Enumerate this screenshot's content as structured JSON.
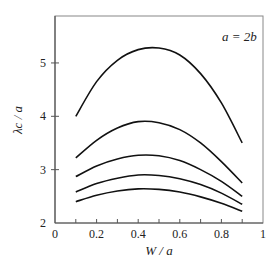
{
  "chart_data": {
    "type": "line",
    "title": "",
    "annotation": "a = 2b",
    "xlabel": "W / a",
    "ylabel": "λc / a",
    "xlim": [
      0,
      1
    ],
    "ylim": [
      2,
      5.88
    ],
    "xticks": [
      0,
      0.2,
      0.4,
      0.6,
      0.8,
      1
    ],
    "xtick_labels": [
      "0",
      "0.2",
      "0.4",
      "0.6",
      "0.8",
      "1"
    ],
    "yticks": [
      2,
      3,
      4,
      5
    ],
    "ytick_labels": [
      "2",
      "3",
      "4",
      "5"
    ],
    "grid": false,
    "legend": null,
    "x": [
      0.1,
      0.2,
      0.3,
      0.4,
      0.5,
      0.6,
      0.7,
      0.8,
      0.9
    ],
    "series": [
      {
        "name": "curve-1",
        "values": [
          4.0,
          4.65,
          5.05,
          5.25,
          5.28,
          5.15,
          4.8,
          4.25,
          3.5
        ]
      },
      {
        "name": "curve-2",
        "values": [
          3.22,
          3.55,
          3.78,
          3.9,
          3.88,
          3.75,
          3.5,
          3.15,
          2.75
        ]
      },
      {
        "name": "curve-3",
        "values": [
          2.87,
          3.07,
          3.2,
          3.27,
          3.26,
          3.17,
          3.0,
          2.78,
          2.5
        ]
      },
      {
        "name": "curve-4",
        "values": [
          2.58,
          2.74,
          2.84,
          2.9,
          2.89,
          2.83,
          2.72,
          2.56,
          2.35
        ]
      },
      {
        "name": "curve-5",
        "values": [
          2.4,
          2.52,
          2.6,
          2.64,
          2.63,
          2.58,
          2.49,
          2.37,
          2.22
        ]
      }
    ]
  }
}
